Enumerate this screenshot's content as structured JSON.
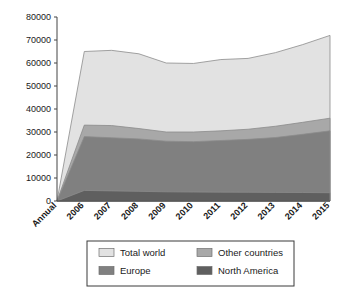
{
  "chart_data": {
    "type": "area",
    "title": "",
    "subtitle": "",
    "xlabel": "",
    "ylabel": "",
    "stacked": true,
    "grid": false,
    "legend_position": "bottom",
    "categories": [
      "Annual",
      "2006",
      "2007",
      "2008",
      "2009",
      "2010",
      "2011",
      "2012",
      "2013",
      "2014",
      "2015"
    ],
    "x_tick_labels": [
      "Annual",
      "2006",
      "2007",
      "2008",
      "2009",
      "2010",
      "2011",
      "2012",
      "2013",
      "2014",
      "2015"
    ],
    "y_tick_labels": [
      "0",
      "10000",
      "20000",
      "30000",
      "40000",
      "50000",
      "60000",
      "70000",
      "80000"
    ],
    "y_ticks": [
      0,
      10000,
      20000,
      30000,
      40000,
      50000,
      60000,
      70000,
      80000
    ],
    "ylim": [
      0,
      80000
    ],
    "series": [
      {
        "name": "Total world",
        "color": "#e2e2e2",
        "values": [
          0,
          65000,
          65500,
          64000,
          60000,
          59800,
          61500,
          62000,
          64500,
          68000,
          72000
        ]
      },
      {
        "name": "Other countries",
        "color": "#a8a8a8",
        "values": [
          0,
          33000,
          32800,
          31500,
          30000,
          30000,
          30500,
          31200,
          32500,
          34200,
          36000
        ]
      },
      {
        "name": "Europe",
        "color": "#808080",
        "values": [
          0,
          28000,
          27500,
          27000,
          26000,
          25800,
          26300,
          26800,
          27600,
          29000,
          30500
        ]
      },
      {
        "name": "North America",
        "color": "#5f5f5f",
        "values": [
          0,
          4600,
          4400,
          4200,
          4000,
          3900,
          3850,
          3800,
          3750,
          3700,
          3600
        ]
      }
    ],
    "legend_entries": [
      {
        "label": "Total world",
        "color": "#e2e2e2"
      },
      {
        "label": "Other countries",
        "color": "#a8a8a8"
      },
      {
        "label": "Europe",
        "color": "#808080"
      },
      {
        "label": "North America",
        "color": "#5f5f5f"
      }
    ]
  }
}
